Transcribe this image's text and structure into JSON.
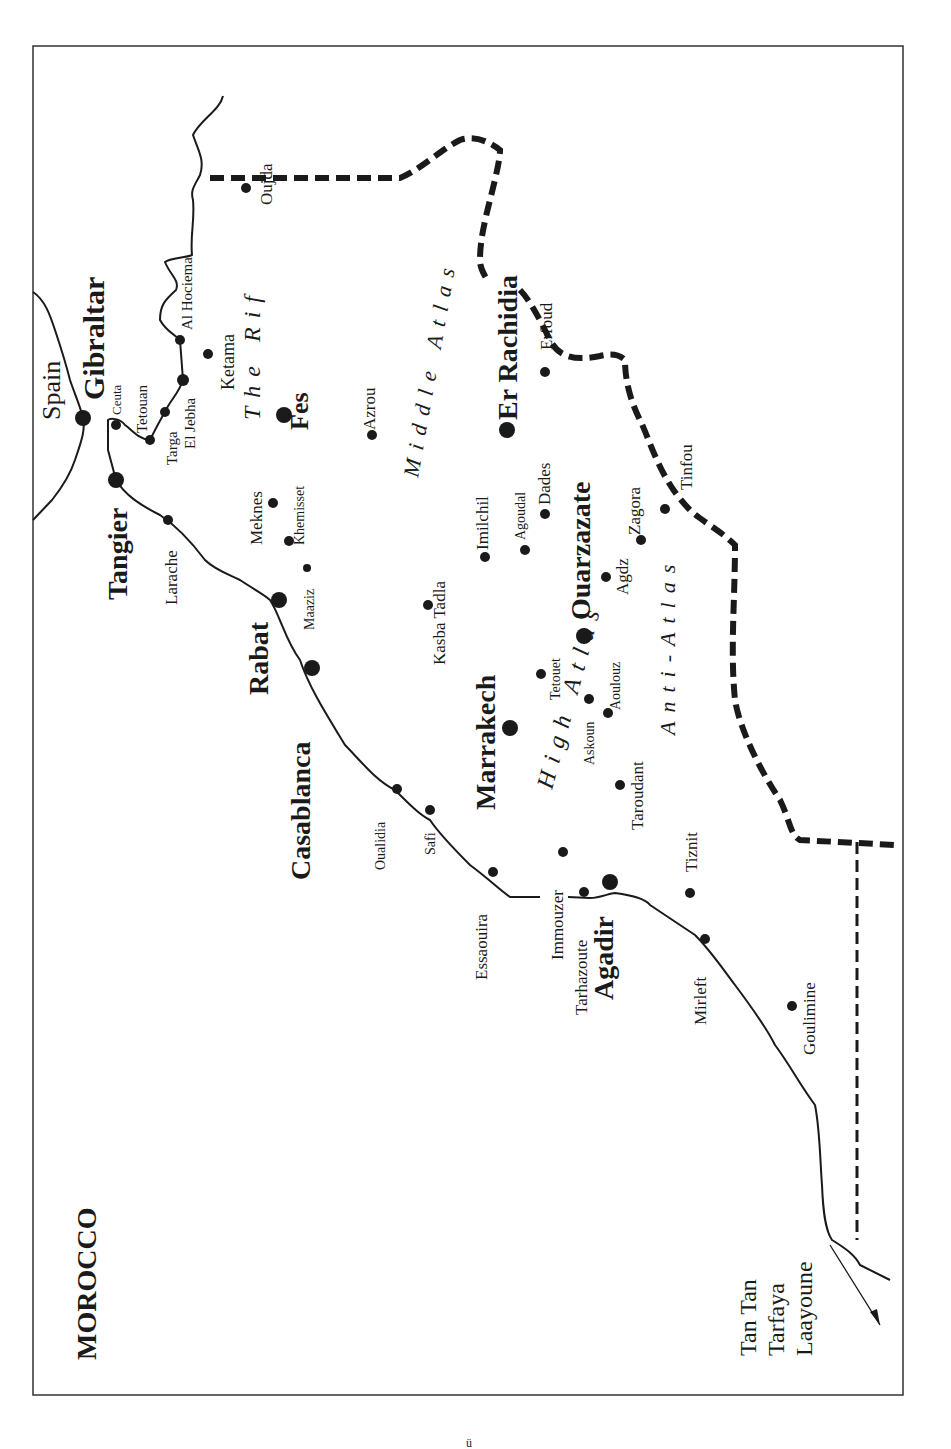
{
  "map": {
    "title": "MOROCCO",
    "countries": {
      "spain": "Spain"
    },
    "major_cities": [
      {
        "name": "Gibraltar"
      },
      {
        "name": "Tangier"
      },
      {
        "name": "Rabat"
      },
      {
        "name": "Casablanca"
      },
      {
        "name": "Fes"
      },
      {
        "name": "Marrakech"
      },
      {
        "name": "Ouarzazate"
      },
      {
        "name": "Er Rachidia"
      },
      {
        "name": "Agadir"
      }
    ],
    "towns": {
      "ceuta": "Ceuta",
      "tetouan": "Tetouan",
      "targa": "Targa",
      "el_jebha": "El Jebha",
      "al_hociema": "Al Hociema",
      "ketama": "Ketama",
      "oujda": "Oujda",
      "larache": "Larache",
      "meknes": "Meknes",
      "khemisset": "Khemisset",
      "maaziz": "Maaziz",
      "azrou": "Azrou",
      "kasba_tadla": "Kasba Tadla",
      "imilchil": "Imilchil",
      "agoudal": "Agoudal",
      "dades": "Dades",
      "erfoud": "Erfoud",
      "tetouet": "Tetouet",
      "agdz": "Agdz",
      "zagora": "Zagora",
      "tinfou": "Tinfou",
      "askoun": "Askoun",
      "aoulouz": "Aoulouz",
      "taroudant": "Taroudant",
      "oualidia": "Oualidia",
      "safi": "Safi",
      "essaouira": "Essaouira",
      "immouzer": "Immouzer",
      "tarhazoute": "Tarhazoute",
      "tiznit": "Tiznit",
      "mirleft": "Mirleft",
      "goulimine": "Goulimine"
    },
    "regions": {
      "rif": "The Rif",
      "middle_atlas": "Middle Atlas",
      "high_atlas": "High Atlas",
      "anti_atlas": "Anti-Atlas"
    },
    "south_destinations": [
      "Tan Tan",
      "Tarfaya",
      "Laayoune"
    ],
    "footer_mark": "ü"
  }
}
